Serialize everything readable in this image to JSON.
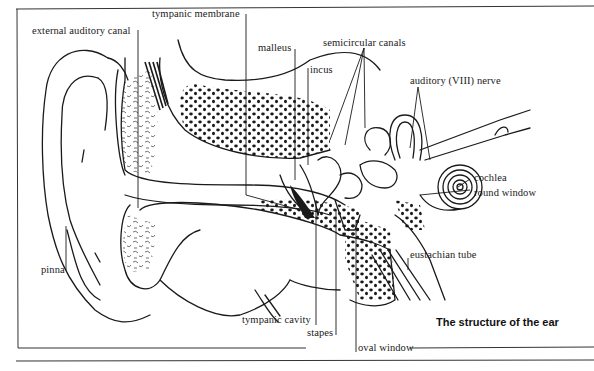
{
  "figure": {
    "caption": "The structure of the ear",
    "colors": {
      "ink": "#1a1a1a",
      "background": "#ffffff"
    }
  },
  "labels": {
    "external_auditory_canal": "external auditory canal",
    "tympanic_membrane": "tympanic membrane",
    "malleus": "malleus",
    "incus": "incus",
    "semicircular_canals": "semicircular canals",
    "auditory_nerve": "auditory (VIII) nerve",
    "cochlea": "cochlea",
    "round_window": "round window",
    "eustachian_tube": "eustachian tube",
    "pinna": "pinna",
    "tympanic_cavity": "tympanic cavity",
    "stapes": "stapes",
    "oval_window": "oval window"
  }
}
